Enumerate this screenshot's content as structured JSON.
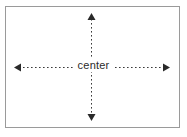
{
  "diagram": {
    "frame": {
      "border_color": "#9a9a9a",
      "background_color": "#ffffff",
      "x": 5,
      "y": 6,
      "width": 175,
      "height": 122
    },
    "label": {
      "text": "center",
      "color": "#2b2b2b"
    },
    "arrows": [
      {
        "name": "horizontal-double-arrow",
        "orientation": "horizontal",
        "style": "dotted",
        "color": "#3a3a3a",
        "start_x": 14,
        "end_x": 170,
        "y": 67,
        "heads": "both"
      },
      {
        "name": "vertical-double-arrow",
        "orientation": "vertical",
        "style": "dotted",
        "color": "#3a3a3a",
        "x": 91,
        "start_y": 14,
        "end_y": 120,
        "heads": "both"
      }
    ]
  }
}
